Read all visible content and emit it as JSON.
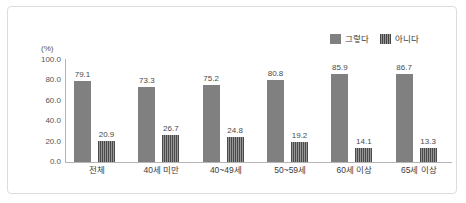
{
  "chart_data": {
    "type": "bar",
    "title": "",
    "subtitle": "",
    "xlabel": "",
    "ylabel": "(%)",
    "unit_label": "(%)",
    "ylim": [
      0,
      100
    ],
    "ytick_step": 20,
    "ytick_labels": [
      "100.0",
      "80.0",
      "60.0",
      "40.0",
      "20.0",
      "0.0"
    ],
    "ytick_values": [
      100,
      80,
      60,
      40,
      20,
      0
    ],
    "grid": false,
    "legend_position": "top-right",
    "categories": [
      "전체",
      "40세 미만",
      "40~49세",
      "50~59세",
      "60세 이상",
      "65세 이상"
    ],
    "series": [
      {
        "name": "그렇다",
        "color": "#808080",
        "pattern": "solid",
        "values": [
          79.1,
          73.3,
          75.2,
          80.8,
          85.9,
          86.7
        ],
        "labels": [
          "79.1",
          "73.3",
          "75.2",
          "80.8",
          "85.9",
          "86.7"
        ]
      },
      {
        "name": "아니다",
        "color": "#6e6e6e",
        "pattern": "vertical-stripes",
        "values": [
          20.9,
          26.7,
          24.8,
          19.2,
          14.1,
          13.3
        ],
        "labels": [
          "20.9",
          "26.7",
          "24.8",
          "19.2",
          "14.1",
          "13.3"
        ]
      }
    ]
  }
}
